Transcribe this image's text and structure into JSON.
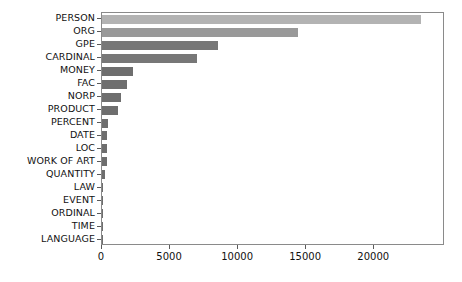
{
  "chart_data": {
    "type": "bar",
    "orientation": "horizontal",
    "title": "",
    "xlabel": "",
    "ylabel": "",
    "xlim": [
      0,
      25200
    ],
    "grid": false,
    "legend": null,
    "bar_color": "#6e6e6e",
    "categories": [
      "PERSON",
      "ORG",
      "GPE",
      "CARDINAL",
      "MONEY",
      "FAC",
      "NORP",
      "PRODUCT",
      "PERCENT",
      "DATE",
      "LOC",
      "WORK OF ART",
      "QUANTITY",
      "LAW",
      "EVENT",
      "ORDINAL",
      "TIME",
      "LANGUAGE"
    ],
    "values": [
      23400,
      14400,
      8500,
      6950,
      2300,
      1850,
      1400,
      1150,
      430,
      400,
      380,
      350,
      220,
      60,
      40,
      30,
      25,
      15
    ],
    "xticks": [
      0,
      5000,
      10000,
      15000,
      20000
    ],
    "xticklabels": [
      "0",
      "5000",
      "10000",
      "15000",
      "20000"
    ]
  },
  "figure": {
    "background_color": "#ffffff",
    "axis_color": "#8a8a8a",
    "tick_color": "#5a5a5a",
    "text_color": "#111111"
  }
}
